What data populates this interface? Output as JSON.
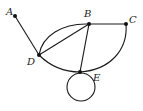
{
  "diagram": {
    "type": "graph",
    "vertices": [
      {
        "id": "A",
        "label": "A",
        "x": 15,
        "y": 16,
        "label_x": 6,
        "label_y": 15
      },
      {
        "id": "B",
        "label": "B",
        "x": 89,
        "y": 24,
        "label_x": 84,
        "label_y": 17
      },
      {
        "id": "C",
        "label": "C",
        "x": 126,
        "y": 24,
        "label_x": 129,
        "label_y": 23
      },
      {
        "id": "D",
        "label": "D",
        "x": 39,
        "y": 55,
        "label_x": 27,
        "label_y": 65
      },
      {
        "id": "E",
        "label": "E",
        "x": 80,
        "y": 72,
        "label_x": 93,
        "label_y": 81
      }
    ],
    "edges": [
      {
        "from": "A",
        "to": "D",
        "kind": "straight"
      },
      {
        "from": "B",
        "to": "C",
        "kind": "straight"
      },
      {
        "from": "D",
        "to": "B",
        "kind": "straight"
      },
      {
        "from": "D",
        "to": "B",
        "kind": "curved"
      },
      {
        "from": "B",
        "to": "E",
        "kind": "straight"
      },
      {
        "from": "D",
        "to": "E",
        "kind": "curved"
      },
      {
        "from": "E",
        "to": "C",
        "kind": "curved"
      },
      {
        "from": "E",
        "to": "E",
        "kind": "loop"
      }
    ],
    "colors": {
      "stroke": "#1a1a1a",
      "vertex": "#111111",
      "label": "#222222"
    }
  }
}
